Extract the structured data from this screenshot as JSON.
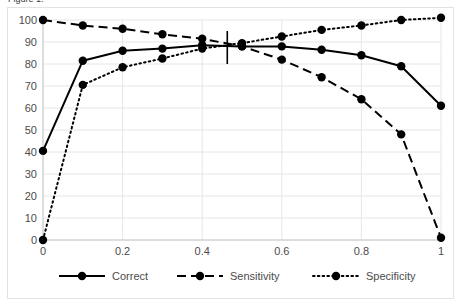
{
  "title_sliver": "Figure 1.",
  "chart_data": {
    "type": "line",
    "title": "",
    "xlabel": "",
    "ylabel": "",
    "x": [
      0,
      0.1,
      0.2,
      0.3,
      0.4,
      0.5,
      0.6,
      0.7,
      0.8,
      0.9,
      1
    ],
    "xlim": [
      0,
      1
    ],
    "ylim": [
      0,
      100
    ],
    "xticks": [
      "0",
      "0.2",
      "0.4",
      "0.6",
      "0.8",
      "1"
    ],
    "xtick_values": [
      0,
      0.2,
      0.4,
      0.6,
      0.8,
      1
    ],
    "yticks": [
      "0",
      "10",
      "20",
      "30",
      "40",
      "50",
      "60",
      "70",
      "80",
      "90",
      "100"
    ],
    "ytick_values": [
      0,
      10,
      20,
      30,
      40,
      50,
      60,
      70,
      80,
      90,
      100
    ],
    "grid": true,
    "grid_axis": "both",
    "legend_position": "bottom",
    "series": [
      {
        "name": "Correct",
        "style": "solid",
        "marker": "circle",
        "color": "#000000",
        "values": [
          40.5,
          81.5,
          86,
          87,
          88.5,
          88,
          88,
          86.5,
          84,
          79,
          61
        ]
      },
      {
        "name": "Sensitivity",
        "style": "dashed",
        "marker": "circle",
        "color": "#000000",
        "values": [
          100,
          97.5,
          96,
          93.5,
          91.5,
          88,
          82,
          74,
          64,
          48,
          1
        ]
      },
      {
        "name": "Specificity",
        "style": "dotted",
        "marker": "circle",
        "color": "#000000",
        "values": [
          0,
          70.5,
          78.5,
          82.5,
          87,
          89.5,
          92.5,
          95.5,
          97.5,
          100,
          101
        ]
      }
    ],
    "annotations": [
      {
        "type": "vertical-line",
        "name": "cutoff-marker",
        "x": 0.463,
        "y_from": 80,
        "y_to": 95,
        "color": "#000000"
      }
    ]
  },
  "legend": {
    "items": [
      {
        "label": "Correct",
        "style": "solid"
      },
      {
        "label": "Sensitivity",
        "style": "dashed"
      },
      {
        "label": "Specificity",
        "style": "dotted"
      }
    ]
  }
}
